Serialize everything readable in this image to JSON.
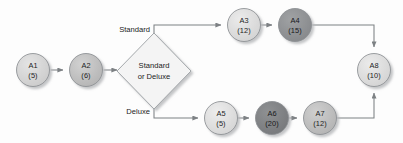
{
  "diagram": {
    "type": "activity-flow-diagram",
    "decision": {
      "label_line1": "Standard",
      "label_line2": "or Deluxe",
      "fill": "#f4f4f4",
      "border": "#9a9ea1"
    },
    "branch_labels": {
      "top": "Standard",
      "bottom": "Deluxe"
    },
    "nodes": [
      {
        "id": "A1",
        "name": "A1",
        "duration": "(5)",
        "cx": 33,
        "cy": 70,
        "r": 16.5,
        "fill": "#d2d2d2",
        "dark": false
      },
      {
        "id": "A2",
        "name": "A2",
        "duration": "(6)",
        "cx": 86,
        "cy": 70,
        "r": 16.5,
        "fill": "#bdbdbd",
        "dark": false
      },
      {
        "id": "A3",
        "name": "A3",
        "duration": "(12)",
        "cx": 244,
        "cy": 25,
        "r": 16.5,
        "fill": "#dadada",
        "dark": false
      },
      {
        "id": "A4",
        "name": "A4",
        "duration": "(15)",
        "cx": 295,
        "cy": 25,
        "r": 16.5,
        "fill": "#8f9193",
        "dark": true
      },
      {
        "id": "A5",
        "name": "A5",
        "duration": "(5)",
        "cx": 221,
        "cy": 118,
        "r": 16.5,
        "fill": "#dcdcdc",
        "dark": false
      },
      {
        "id": "A6",
        "name": "A6",
        "duration": "(20)",
        "cx": 272,
        "cy": 118,
        "r": 16.5,
        "fill": "#7f8183",
        "dark": true
      },
      {
        "id": "A7",
        "name": "A7",
        "duration": "(12)",
        "cx": 320,
        "cy": 118,
        "r": 16.5,
        "fill": "#bcbcbc",
        "dark": false
      },
      {
        "id": "A8",
        "name": "A8",
        "duration": "(10)",
        "cx": 374,
        "cy": 70,
        "r": 16.5,
        "fill": "#dadada",
        "dark": false
      }
    ],
    "connector_color": "#7d8184",
    "connectors": [
      {
        "from": "A1",
        "to": "A2"
      },
      {
        "from": "A2",
        "to": "decision"
      },
      {
        "from": "decision",
        "to": "A3",
        "label": "Standard"
      },
      {
        "from": "A3",
        "to": "A4"
      },
      {
        "from": "A4",
        "to": "A8"
      },
      {
        "from": "decision",
        "to": "A5",
        "label": "Deluxe"
      },
      {
        "from": "A5",
        "to": "A6"
      },
      {
        "from": "A6",
        "to": "A7"
      },
      {
        "from": "A7",
        "to": "A8"
      }
    ]
  }
}
